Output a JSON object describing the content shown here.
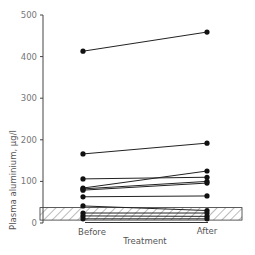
{
  "chart_data": {
    "type": "line",
    "title": "",
    "xlabel": "Treatment",
    "ylabel": "Plasma aluminium, µg/l",
    "categories": [
      "Before",
      "After"
    ],
    "ylim": [
      0,
      500
    ],
    "yticks": [
      0,
      100,
      200,
      300,
      400,
      500
    ],
    "ytick_labels": [
      "0",
      "100",
      "200",
      "300",
      "400",
      "500"
    ],
    "grid": false,
    "legend": null,
    "reference_band": {
      "description": "hatched normal range",
      "low": 7,
      "high": 37
    },
    "series": [
      {
        "name": "Patient 1",
        "values": [
          413,
          459
        ]
      },
      {
        "name": "Patient 2",
        "values": [
          166,
          192
        ]
      },
      {
        "name": "Patient 3",
        "values": [
          106,
          110
        ]
      },
      {
        "name": "Patient 4",
        "values": [
          84,
          125
        ]
      },
      {
        "name": "Patient 5",
        "values": [
          82,
          100
        ]
      },
      {
        "name": "Patient 6",
        "values": [
          79,
          96
        ]
      },
      {
        "name": "Patient 7",
        "values": [
          63,
          65
        ]
      },
      {
        "name": "Patient 8",
        "values": [
          41,
          30
        ]
      },
      {
        "name": "Patient 9",
        "values": [
          24,
          24
        ]
      },
      {
        "name": "Patient 10",
        "values": [
          17,
          16
        ]
      },
      {
        "name": "Patient 11",
        "values": [
          10,
          10
        ]
      }
    ]
  },
  "labels": {
    "x_before": "Before",
    "x_after": "After",
    "x_title": "Treatment",
    "y_title": "Plasma aluminium, µg/l"
  }
}
